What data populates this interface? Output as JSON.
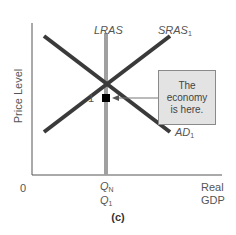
{
  "diagram": {
    "type": "AD-AS model",
    "y_axis_label": "Price Level",
    "x_axis_label_line1": "Real",
    "x_axis_label_line2": "GDP",
    "origin_label": "0",
    "curves": {
      "lras": {
        "label": "LRAS",
        "color": "#a0a0a0"
      },
      "sras": {
        "label": "SRAS",
        "subscript": "1",
        "color": "#3a3a3a"
      },
      "ad": {
        "label": "AD",
        "subscript": "1",
        "color": "#3a3a3a"
      }
    },
    "equilibrium": {
      "label": "1",
      "color": "#000000"
    },
    "x_ticks": {
      "qn": {
        "label": "Q",
        "subscript": "N"
      },
      "q1": {
        "label": "Q",
        "subscript": "1"
      }
    },
    "callout": {
      "text": "The economy is here.",
      "line1": "The",
      "line2": "economy",
      "line3": "is here.",
      "background": "#e3e3e3"
    },
    "caption": "(c)"
  }
}
